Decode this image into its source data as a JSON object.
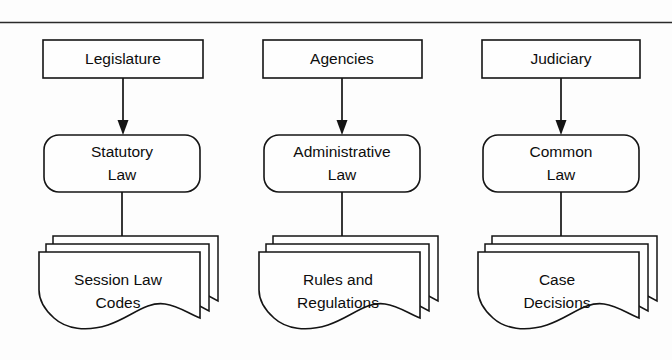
{
  "diagram": {
    "type": "flow-diagram",
    "background_color": "#fdfdfd",
    "stroke_color": "#141414",
    "top_rule": true,
    "columns": [
      {
        "id": "legislative",
        "source_label": "Legislature",
        "law_label_line1": "Statutory",
        "law_label_line2": "Law",
        "output_label_line1": "Session Law",
        "output_label_line2": "Codes"
      },
      {
        "id": "administrative",
        "source_label": "Agencies",
        "law_label_line1": "Administrative",
        "law_label_line2": "Law",
        "output_label_line1": "Rules and",
        "output_label_line2": "Regulations"
      },
      {
        "id": "judicial",
        "source_label": "Judiciary",
        "law_label_line1": "Common",
        "law_label_line2": "Law",
        "output_label_line1": "Case",
        "output_label_line2": "Decisions"
      }
    ]
  }
}
